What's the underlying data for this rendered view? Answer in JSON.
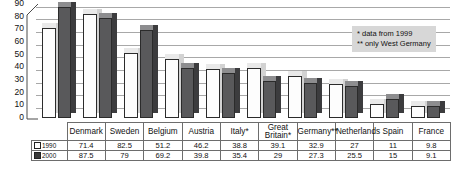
{
  "chart_data": {
    "type": "bar",
    "title": "",
    "xlabel": "",
    "ylabel": "",
    "ylim": [
      0,
      90
    ],
    "yticks": [
      0,
      10,
      20,
      30,
      40,
      50,
      60,
      70,
      80,
      90
    ],
    "grid": true,
    "legend_position": "table-left",
    "categories": [
      "Denmark",
      "Sweden",
      "Belgium",
      "Austria",
      "Italy*",
      "Great Britain*",
      "Germany**",
      "Netherlands",
      "Spain",
      "France"
    ],
    "series": [
      {
        "name": "1990",
        "values": [
          71.4,
          82.5,
          51.2,
          46.2,
          38.8,
          39.1,
          32.9,
          27,
          11,
          9.8
        ]
      },
      {
        "name": "2000",
        "values": [
          87.5,
          79,
          69.2,
          39.8,
          35.4,
          29,
          27.3,
          25.5,
          15,
          9.1
        ]
      }
    ],
    "annotations": [
      "* data from 1999",
      "** only West Germany"
    ],
    "colors": {
      "series_1990": "#fdfdfd",
      "series_2000": "#59595b",
      "grid": "#a8a8a8",
      "annotation_bg": "#d7d7d7"
    }
  },
  "legend": {
    "row_1990": "1990",
    "row_2000": "2000"
  }
}
